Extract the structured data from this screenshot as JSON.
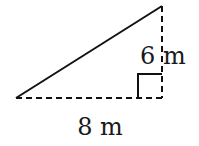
{
  "diagram": {
    "type": "right-triangle",
    "labels": {
      "height": "6 m",
      "base": "8 m"
    },
    "colors": {
      "stroke": "#111111",
      "background": "#ffffff"
    }
  }
}
